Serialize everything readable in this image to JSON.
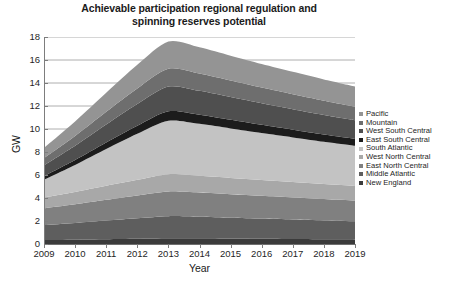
{
  "chart_data": {
    "type": "area",
    "title": "Achievable participation regional regulation and spinning reserves potential",
    "title_lines": [
      "Achievable participation regional regulation and",
      "spinning reserves potential"
    ],
    "xlabel": "Year",
    "ylabel": "GW",
    "x": [
      2009,
      2010,
      2011,
      2012,
      2013,
      2014,
      2015,
      2016,
      2017,
      2018,
      2019
    ],
    "categories": [
      "2009",
      "2010",
      "2011",
      "2012",
      "2013",
      "2014",
      "2015",
      "2016",
      "2017",
      "2018",
      "2019"
    ],
    "xlim": [
      2009,
      2019
    ],
    "ylim": [
      0,
      18
    ],
    "y_ticks": [
      0,
      2,
      4,
      6,
      8,
      10,
      12,
      14,
      16,
      18
    ],
    "y_tick_labels": [
      "0",
      "2",
      "4",
      "6",
      "8",
      "10",
      "12",
      "14",
      "16",
      "18"
    ],
    "grid": true,
    "grid_axis": "y",
    "stacked": true,
    "stack_order": "bottom-to-top",
    "legend_position": "right",
    "series": [
      {
        "name": "New England",
        "color": "#3b3b3b",
        "values": [
          0.35,
          0.38,
          0.42,
          0.46,
          0.5,
          0.49,
          0.47,
          0.45,
          0.43,
          0.41,
          0.4
        ]
      },
      {
        "name": "Middle Atlantic",
        "color": "#5e5e5e",
        "values": [
          1.3,
          1.45,
          1.62,
          1.78,
          1.92,
          1.88,
          1.82,
          1.76,
          1.7,
          1.64,
          1.58
        ]
      },
      {
        "name": "East North Central",
        "color": "#808080",
        "values": [
          1.45,
          1.62,
          1.8,
          1.98,
          2.15,
          2.1,
          2.04,
          1.98,
          1.92,
          1.86,
          1.8
        ]
      },
      {
        "name": "West North Central",
        "color": "#a8a8a8",
        "values": [
          0.95,
          1.08,
          1.22,
          1.36,
          1.5,
          1.46,
          1.42,
          1.38,
          1.34,
          1.3,
          1.26
        ]
      },
      {
        "name": "South Atlantic",
        "color": "#c3c3c3",
        "values": [
          1.55,
          2.35,
          3.2,
          4.0,
          4.65,
          4.52,
          4.3,
          4.08,
          3.88,
          3.68,
          3.5
        ]
      },
      {
        "name": "East South Central",
        "color": "#1c1c1c",
        "values": [
          0.3,
          0.42,
          0.56,
          0.7,
          0.82,
          0.79,
          0.75,
          0.71,
          0.67,
          0.63,
          0.6
        ]
      },
      {
        "name": "West South Central",
        "color": "#4f4f4f",
        "values": [
          0.95,
          1.25,
          1.58,
          1.9,
          2.15,
          2.08,
          1.98,
          1.88,
          1.78,
          1.7,
          1.62
        ]
      },
      {
        "name": "Mountain",
        "color": "#6e6e6e",
        "values": [
          0.62,
          0.85,
          1.1,
          1.35,
          1.55,
          1.5,
          1.43,
          1.36,
          1.3,
          1.24,
          1.18
        ]
      },
      {
        "name": "Pacific",
        "color": "#949494",
        "values": [
          0.88,
          1.25,
          1.65,
          2.05,
          2.36,
          2.28,
          2.16,
          2.05,
          1.95,
          1.85,
          1.76
        ]
      }
    ],
    "legend_entries": [
      "Pacific",
      "Mountain",
      "West South Central",
      "East South Central",
      "South Atlantic",
      "West North Central",
      "East North Central",
      "Middle Atlantic",
      "New England"
    ],
    "totals": [
      8.35,
      10.65,
      13.15,
      15.58,
      17.6,
      17.1,
      16.37,
      15.65,
      14.97,
      14.31,
      13.7
    ],
    "peak_year": 2013,
    "peak_value": 17.6
  }
}
